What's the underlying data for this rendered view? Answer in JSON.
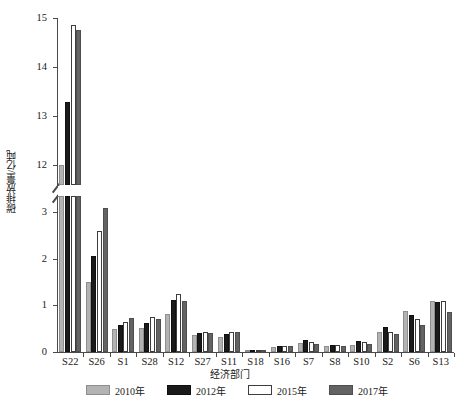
{
  "chart_data": {
    "type": "bar",
    "title": "",
    "xlabel": "经济部门",
    "ylabel": "碳排放量/亿吨",
    "categories": [
      "S22",
      "S26",
      "S1",
      "S28",
      "S12",
      "S27",
      "S11",
      "S18",
      "S16",
      "S7",
      "S8",
      "S10",
      "S2",
      "S6",
      "S13"
    ],
    "series": [
      {
        "name": "2010年",
        "color": "#b3b3b3",
        "values": [
          12.0,
          1.5,
          0.5,
          0.52,
          0.82,
          0.36,
          0.33,
          0.04,
          0.1,
          0.2,
          0.12,
          0.16,
          0.44,
          0.88,
          1.1
        ]
      },
      {
        "name": "2012年",
        "color": "#1a1a1a",
        "values": [
          13.3,
          2.07,
          0.58,
          0.62,
          1.12,
          0.4,
          0.38,
          0.05,
          0.12,
          0.25,
          0.16,
          0.23,
          0.53,
          0.8,
          1.07
        ]
      },
      {
        "name": "2015年",
        "color": "#ffffff",
        "values": [
          14.85,
          2.6,
          0.64,
          0.75,
          1.24,
          0.42,
          0.44,
          0.05,
          0.13,
          0.21,
          0.14,
          0.21,
          0.44,
          0.7,
          1.1
        ]
      },
      {
        "name": "2017年",
        "color": "#636363",
        "values": [
          14.75,
          3.1,
          0.74,
          0.7,
          1.1,
          0.41,
          0.42,
          0.05,
          0.13,
          0.17,
          0.12,
          0.18,
          0.38,
          0.58,
          0.85
        ]
      }
    ],
    "y_axis": {
      "lower_ticks": [
        "0",
        "1",
        "2",
        "3"
      ],
      "upper_ticks": [
        "12",
        "13",
        "14",
        "15"
      ],
      "lower_range": [
        0,
        3.35
      ],
      "upper_range": [
        11.6,
        15.0
      ],
      "broken_axis": true
    },
    "grid": false,
    "legend_position": "bottom"
  },
  "legend": {
    "items": [
      {
        "label": "2010年"
      },
      {
        "label": "2012年"
      },
      {
        "label": "2015年"
      },
      {
        "label": "2017年"
      }
    ]
  }
}
